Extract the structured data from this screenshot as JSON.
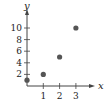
{
  "chart_data": {
    "type": "scatter",
    "title": "",
    "xlabel": "x",
    "ylabel": "y",
    "x": [
      0,
      1,
      2,
      3
    ],
    "y": [
      1,
      2,
      5,
      10
    ],
    "series": [
      {
        "name": "points",
        "x": [
          0,
          1,
          2,
          3
        ],
        "y": [
          1,
          2,
          5,
          10
        ]
      }
    ],
    "xticks": [
      "1",
      "2",
      "3"
    ],
    "yticks": [
      "2",
      "4",
      "6",
      "8",
      "10"
    ],
    "xlim": [
      0,
      3.9
    ],
    "ylim": [
      0,
      12.5
    ],
    "grid": false,
    "legend": null,
    "colors": {
      "axis": "#444444",
      "point": "#555555",
      "text": "#222222"
    }
  }
}
